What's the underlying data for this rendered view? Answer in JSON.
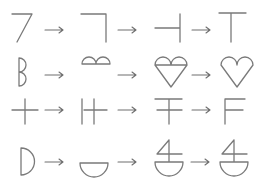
{
  "diagram": {
    "layout": {
      "rows": 4,
      "columns": 4
    },
    "colors": {
      "stroke": "#7a7a7a",
      "background": "#ffffff"
    },
    "arrow_symbol": "→",
    "rows": [
      {
        "id": "row-1",
        "steps": [
          "seven-shape",
          "right-angle-corner",
          "left-tee",
          "tee"
        ]
      },
      {
        "id": "row-2",
        "steps": [
          "letter-b",
          "double-arch",
          "heart-with-arches",
          "heart"
        ]
      },
      {
        "id": "row-3",
        "steps": [
          "plus",
          "double-bar-cross",
          "double-crossbar-t",
          "letter-f"
        ]
      },
      {
        "id": "row-4",
        "steps": [
          "letter-d",
          "half-bowl",
          "four-on-bowl",
          "four-on-bowl"
        ]
      }
    ]
  }
}
